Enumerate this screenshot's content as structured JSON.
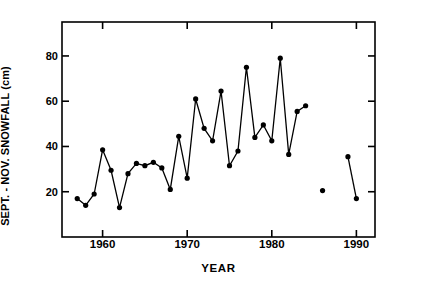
{
  "chart_data": {
    "type": "line",
    "title": "",
    "xlabel": "YEAR",
    "ylabel": "SEPT. - NOV. SNOWFALL (cm)",
    "xlim": [
      1955.2,
      1992.2
    ],
    "ylim": [
      0,
      95
    ],
    "grid": false,
    "legend": null,
    "marker": "filled-circle",
    "line_color": "#000000",
    "xticks": [
      1960,
      1970,
      1980,
      1990
    ],
    "xtick_labels": [
      "1960",
      "1970",
      "1980",
      "1990"
    ],
    "yticks": [
      20,
      40,
      60,
      80
    ],
    "ytick_labels": [
      "20",
      "40",
      "60",
      "80"
    ],
    "series": [
      {
        "name": "Sept-Nov snowfall",
        "x": [
          1957,
          1958,
          1959,
          1960,
          1961,
          1962,
          1963,
          1964,
          1965,
          1966,
          1967,
          1968,
          1969,
          1970,
          1971,
          1972,
          1973,
          1974,
          1975,
          1976,
          1977,
          1978,
          1979,
          1980,
          1981,
          1982,
          1983,
          1984
        ],
        "values": [
          17,
          14,
          19,
          38.5,
          29.5,
          13,
          28,
          32.5,
          31.5,
          33,
          30.5,
          21,
          44.5,
          26,
          61,
          48,
          42.5,
          64.5,
          31.5,
          38,
          75,
          44,
          49.5,
          42.5,
          79,
          36.5,
          55.5,
          58
        ]
      },
      {
        "name": "Sept-Nov snowfall (isolated 1986)",
        "x": [
          1986
        ],
        "values": [
          20.5
        ]
      },
      {
        "name": "Sept-Nov snowfall (1989-1990)",
        "x": [
          1989,
          1990
        ],
        "values": [
          35.5,
          17
        ]
      }
    ]
  },
  "axes": {
    "frame_color": "#000000",
    "background": "#ffffff"
  }
}
